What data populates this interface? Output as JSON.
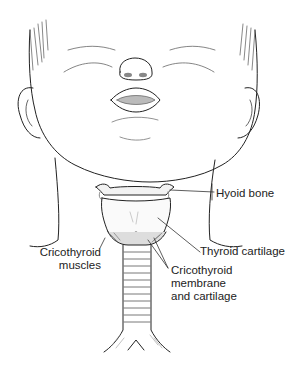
{
  "figure": {
    "labels": {
      "hyoid_bone": "Hyoid bone",
      "thyroid_cartilage": "Thyroid cartilage",
      "cricothyroid_muscles_line1": "Cricothyroid",
      "cricothyroid_muscles_line2": "muscles",
      "cricothyroid_membrane_line1": "Cricothyroid",
      "cricothyroid_membrane_line2": "membrane",
      "cricothyroid_membrane_line3": "and cartilage"
    },
    "colors": {
      "line": "#222222",
      "shade": "#999999",
      "background": "#ffffff"
    }
  }
}
